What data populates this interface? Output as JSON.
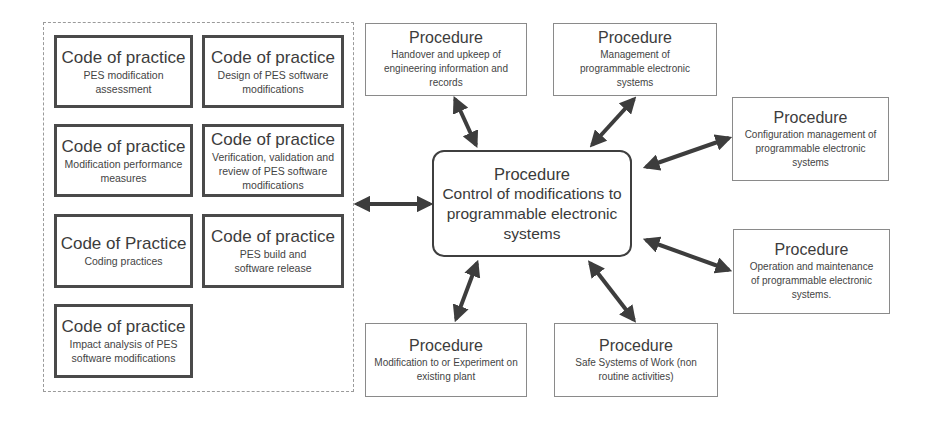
{
  "diagram": {
    "colors": {
      "box_border_strong": "#4a4a4a",
      "box_border_light": "#8a8a8a",
      "arrow": "#3d3d3d",
      "text": "#3c3c3c",
      "background": "#ffffff"
    },
    "central": {
      "title": "Procedure",
      "subtitle": "Control of modifications to programmable electronic systems"
    },
    "codes_of_practice": [
      {
        "title": "Code of practice",
        "subtitle": "PES modification assessment"
      },
      {
        "title": "Code of practice",
        "subtitle": "Design of PES software modifications"
      },
      {
        "title": "Code of practice",
        "subtitle": "Modification performance measures"
      },
      {
        "title": "Code of practice",
        "subtitle": "Verification, validation and review of PES software modifications"
      },
      {
        "title": "Code of Practice",
        "subtitle": "Coding practices"
      },
      {
        "title": "Code of practice",
        "subtitle": "PES build and software release"
      },
      {
        "title": "Code of practice",
        "subtitle": "Impact analysis of PES software modifications"
      }
    ],
    "procedures": {
      "handover": {
        "title": "Procedure",
        "subtitle": "Handover and upkeep of engineering information and records"
      },
      "management": {
        "title": "Procedure",
        "subtitle": "Management of programmable electronic systems"
      },
      "configuration": {
        "title": "Procedure",
        "subtitle": "Configuration management of programmable electronic systems"
      },
      "operation": {
        "title": "Procedure",
        "subtitle": "Operation and maintenance of programmable electronic systems."
      },
      "modification": {
        "title": "Procedure",
        "subtitle": "Modification to or Experiment on existing plant"
      },
      "safe_systems": {
        "title": "Procedure",
        "subtitle": "Safe Systems of Work (non routine activities)"
      }
    },
    "connections": [
      {
        "from": "codes-of-practice-group",
        "to": "central",
        "type": "bidirectional"
      },
      {
        "from": "handover",
        "to": "central",
        "type": "bidirectional"
      },
      {
        "from": "management",
        "to": "central",
        "type": "bidirectional"
      },
      {
        "from": "configuration",
        "to": "central",
        "type": "bidirectional"
      },
      {
        "from": "operation",
        "to": "central",
        "type": "bidirectional"
      },
      {
        "from": "modification",
        "to": "central",
        "type": "bidirectional"
      },
      {
        "from": "safe_systems",
        "to": "central",
        "type": "bidirectional"
      }
    ]
  }
}
